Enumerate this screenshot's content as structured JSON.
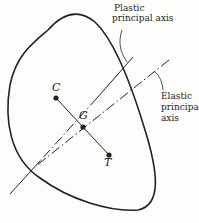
{
  "diagram": {
    "labels": {
      "plastic_axis_line1": "Plastic",
      "plastic_axis_line2": "principal axis",
      "elastic_axis_line1": "Elastic",
      "elastic_axis_line2": "principal",
      "elastic_axis_line3": "axis",
      "point_c": "C",
      "point_g": "G",
      "point_t": "T"
    },
    "colors": {
      "stroke": "#222222",
      "background": "#fdfdfc"
    }
  }
}
